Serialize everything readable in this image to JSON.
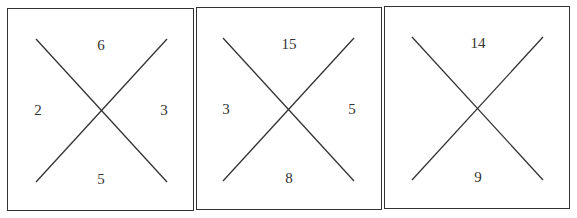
{
  "figure": {
    "panels": [
      {
        "top": "6",
        "left": "2",
        "right": "3",
        "bottom": "5"
      },
      {
        "top": "15",
        "left": "3",
        "right": "5",
        "bottom": "8"
      },
      {
        "top": "14",
        "left": "",
        "right": "",
        "bottom": "9"
      }
    ],
    "line_color": "#333333"
  }
}
